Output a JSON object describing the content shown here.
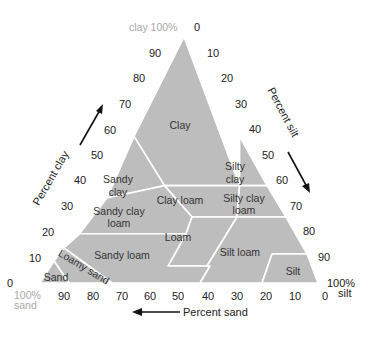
{
  "colors": {
    "region_fill": "#bdbdbd",
    "boundary": "#ffffff",
    "text": "#333333",
    "corner_label": "#a8a8a8"
  },
  "corners": {
    "top": "clay 100%",
    "left_line1": "100%",
    "left_line2": "sand",
    "right_line1": "100%",
    "right_line2": "silt"
  },
  "axes": {
    "clay": {
      "label": "Percent clay",
      "ticks": [
        "0",
        "10",
        "20",
        "30",
        "40",
        "50",
        "60",
        "70",
        "80",
        "90"
      ]
    },
    "silt": {
      "label": "Percent silt",
      "ticks": [
        "0",
        "10",
        "20",
        "30",
        "40",
        "50",
        "60",
        "70",
        "80",
        "90"
      ]
    },
    "sand": {
      "label": "Percent sand",
      "ticks": [
        "90",
        "80",
        "70",
        "60",
        "50",
        "40",
        "30",
        "20",
        "10",
        "0"
      ]
    }
  },
  "regions": [
    {
      "name": "Clay",
      "lines": [
        "Clay"
      ]
    },
    {
      "name": "Sandy clay",
      "lines": [
        "Sandy",
        "clay"
      ]
    },
    {
      "name": "Silty clay",
      "lines": [
        "Silty",
        "clay"
      ]
    },
    {
      "name": "Clay loam",
      "lines": [
        "Clay loam"
      ]
    },
    {
      "name": "Silty clay loam",
      "lines": [
        "Silty clay",
        "loam"
      ]
    },
    {
      "name": "Sandy clay loam",
      "lines": [
        "Sandy clay",
        "loam"
      ]
    },
    {
      "name": "Loam",
      "lines": [
        "Loam"
      ]
    },
    {
      "name": "Sandy loam",
      "lines": [
        "Sandy loam"
      ]
    },
    {
      "name": "Silt loam",
      "lines": [
        "Silt loam"
      ]
    },
    {
      "name": "Silt",
      "lines": [
        "Silt"
      ]
    },
    {
      "name": "Loamy sand",
      "lines": [
        "Loamy sand"
      ]
    },
    {
      "name": "Sand",
      "lines": [
        "Sand"
      ]
    }
  ]
}
